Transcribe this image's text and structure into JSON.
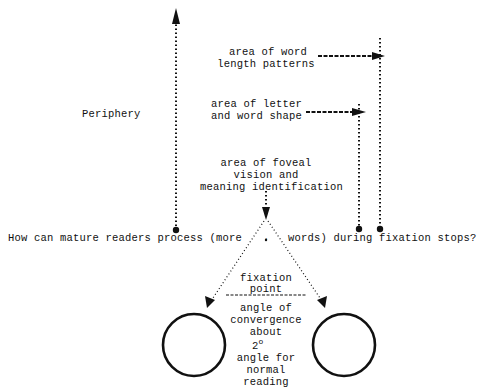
{
  "labels": {
    "periphery": "Periphery",
    "word_length_line1": "area of word",
    "word_length_line2": "length patterns",
    "letter_shape_line1": "area of letter",
    "letter_shape_line2": "and word shape",
    "foveal_line1": "area of foveal",
    "foveal_line2": "vision and",
    "foveal_line3": "meaning identification",
    "question_part1": "How can mature readers process (more",
    "question_dot": ".",
    "question_part2": "words) during fixation stops?",
    "fixation_line1": "fixation",
    "fixation_line2": "point",
    "convergence_line1": "angle of",
    "convergence_line2": "convergence",
    "convergence_line3": "about",
    "convergence_degrees": "2",
    "degree_symbol": "o",
    "reading_line1": "angle for",
    "reading_line2": "normal",
    "reading_line3": "reading"
  },
  "colors": {
    "ink": "#111111",
    "background": "#ffffff"
  }
}
